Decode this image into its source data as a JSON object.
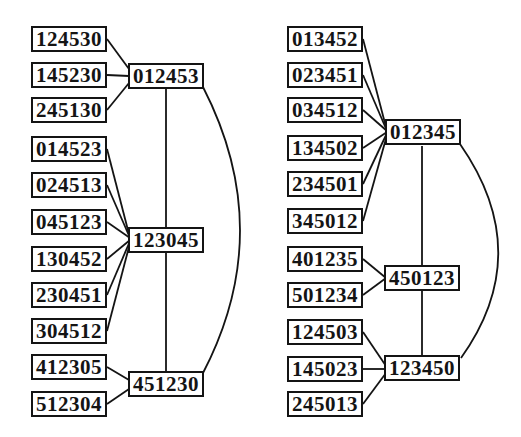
{
  "figure": {
    "kind": "scanned graph diagram",
    "background_color": "#ffffff",
    "ink_color": "#141414",
    "box_fill": "#ffffff"
  },
  "left": {
    "leaves": [
      "124530",
      "145230",
      "245130",
      "014523",
      "024513",
      "045123",
      "130452",
      "230451",
      "304512",
      "412305",
      "512304"
    ],
    "hubs": [
      "012453",
      "123045",
      "451230"
    ],
    "leaf_edges": [
      {
        "from": "124530",
        "to": "012453"
      },
      {
        "from": "145230",
        "to": "012453"
      },
      {
        "from": "245130",
        "to": "012453"
      },
      {
        "from": "014523",
        "to": "123045"
      },
      {
        "from": "024513",
        "to": "123045"
      },
      {
        "from": "045123",
        "to": "123045"
      },
      {
        "from": "130452",
        "to": "123045"
      },
      {
        "from": "230451",
        "to": "123045"
      },
      {
        "from": "304512",
        "to": "123045"
      },
      {
        "from": "412305",
        "to": "451230"
      },
      {
        "from": "512304",
        "to": "451230"
      }
    ],
    "hub_edges": [
      {
        "from": "012453",
        "to": "123045",
        "style": "straight"
      },
      {
        "from": "123045",
        "to": "451230",
        "style": "straight"
      },
      {
        "from": "012453",
        "to": "451230",
        "style": "arc-right"
      }
    ]
  },
  "right": {
    "leaves": [
      "013452",
      "023451",
      "034512",
      "134502",
      "234501",
      "345012",
      "401235",
      "501234",
      "124503",
      "145023",
      "245013"
    ],
    "hubs": [
      "012345",
      "450123",
      "123450"
    ],
    "leaf_edges": [
      {
        "from": "013452",
        "to": "012345"
      },
      {
        "from": "023451",
        "to": "012345"
      },
      {
        "from": "034512",
        "to": "012345"
      },
      {
        "from": "134502",
        "to": "012345"
      },
      {
        "from": "234501",
        "to": "012345"
      },
      {
        "from": "345012",
        "to": "012345"
      },
      {
        "from": "401235",
        "to": "450123"
      },
      {
        "from": "501234",
        "to": "450123"
      },
      {
        "from": "124503",
        "to": "123450"
      },
      {
        "from": "145023",
        "to": "123450"
      },
      {
        "from": "245013",
        "to": "123450"
      }
    ],
    "hub_edges": [
      {
        "from": "012345",
        "to": "450123",
        "style": "straight"
      },
      {
        "from": "450123",
        "to": "123450",
        "style": "straight"
      },
      {
        "from": "012345",
        "to": "123450",
        "style": "arc-right"
      }
    ]
  }
}
